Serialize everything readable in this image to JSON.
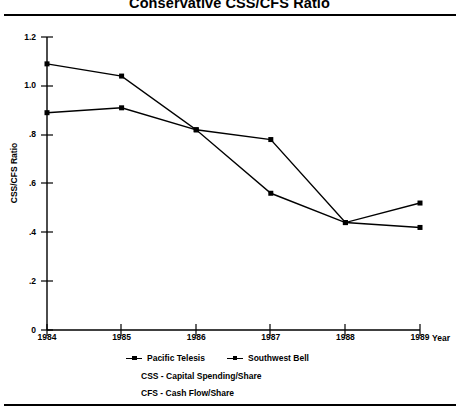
{
  "chart_data": {
    "type": "line",
    "title": "Conservative CSS/CFS Ratio",
    "xlabel": "Year",
    "ylabel": "CSS/CFS Ratio",
    "categories": [
      "1984",
      "1985",
      "1986",
      "1987",
      "1988",
      "1989"
    ],
    "x": [
      1984,
      1985,
      1986,
      1987,
      1988,
      1989
    ],
    "xlim": [
      1984,
      1989
    ],
    "ylim": [
      0,
      1.2
    ],
    "yticks": [
      "0",
      ".2",
      ".4",
      ".6",
      ".8",
      "1.0",
      "1.2"
    ],
    "ytick_values": [
      0,
      0.2,
      0.4,
      0.6,
      0.8,
      1.0,
      1.2
    ],
    "grid": false,
    "legend_position": "below-axis",
    "marker": "square",
    "series": [
      {
        "name": "Pacific Telesis",
        "values": [
          1.09,
          1.04,
          0.82,
          0.78,
          0.44,
          0.52
        ],
        "color": "#000000"
      },
      {
        "name": "Southwest Bell",
        "values": [
          0.89,
          0.91,
          0.82,
          0.56,
          0.44,
          0.42
        ],
        "color": "#000000"
      }
    ],
    "annotations": [
      "CSS - Capital Spending/Share",
      "CFS - Cash Flow/Share"
    ]
  },
  "legend": [
    {
      "label": "Pacific Telesis"
    },
    {
      "label": "Southwest Bell"
    }
  ],
  "footnotes": [
    "CSS - Capital Spending/Share",
    "CFS - Cash Flow/Share"
  ]
}
